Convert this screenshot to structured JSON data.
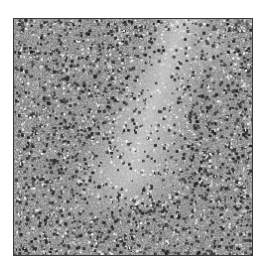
{
  "image": {
    "kind": "grayscale histology micrograph",
    "description": "Dense field of small dark nuclei with a paler, less cellular band extending diagonally from upper-center down toward the middle",
    "colors": {
      "background": "#ffffff",
      "border": "#3a3a3a",
      "tissue_base": "#9a9a9a",
      "nucleus_dark": "#2e2e2e",
      "pale_region": "#c4c4c4"
    }
  }
}
